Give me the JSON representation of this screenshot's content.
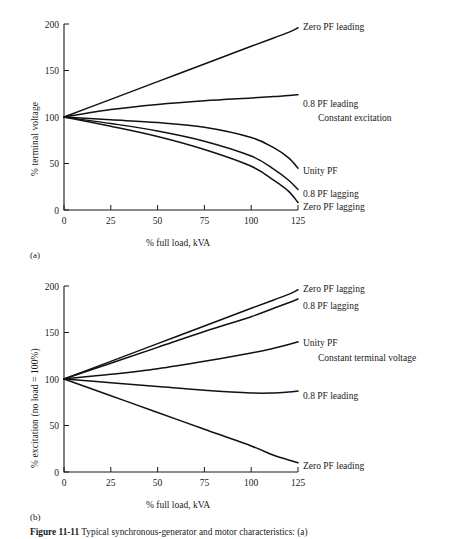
{
  "figure": {
    "caption_bold": "Figure 11-11",
    "caption_text": "Typical synchronous-generator and motor characteristics: (a)",
    "panel_a_tag": "(a)",
    "panel_b_tag": "(b)"
  },
  "chart_data": [
    {
      "type": "line",
      "id": "panel-a",
      "title": "",
      "xlabel": "% full load, kVA",
      "ylabel": "% terminal voltage",
      "annotation": "Constant excitation",
      "xlim": [
        0,
        125
      ],
      "ylim": [
        0,
        200
      ],
      "xticks": [
        0,
        25,
        50,
        75,
        100,
        125
      ],
      "xticklabels": [
        "0",
        "25",
        "50",
        "75",
        "100",
        "125"
      ],
      "yticks": [
        0,
        50,
        100,
        150,
        200
      ],
      "yticklabels": [
        "0",
        "50",
        "100",
        "150",
        "200"
      ],
      "grid": false,
      "legend_position": "right-inline",
      "x": [
        0,
        25,
        50,
        75,
        100,
        112,
        120,
        125
      ],
      "series": [
        {
          "name": "Zero PF leading",
          "values": [
            100,
            119,
            138,
            157,
            176,
            185,
            191,
            196
          ]
        },
        {
          "name": "0.8 PF leading",
          "values": [
            100,
            108,
            113.5,
            117.5,
            120.5,
            122,
            123,
            124
          ]
        },
        {
          "name": "Unity PF",
          "values": [
            100,
            97,
            94,
            89,
            78,
            67,
            56,
            45
          ]
        },
        {
          "name": "0.8 PF lagging",
          "values": [
            100,
            93,
            85,
            74,
            58,
            44,
            32,
            22
          ]
        },
        {
          "name": "Zero PF lagging",
          "values": [
            100,
            90,
            79,
            65,
            47,
            32,
            20,
            8
          ]
        }
      ]
    },
    {
      "type": "line",
      "id": "panel-b",
      "title": "",
      "xlabel": "% full load, kVA",
      "ylabel": "% excitation (no load = 100%)",
      "annotation": "Constant terminal voltage",
      "xlim": [
        0,
        125
      ],
      "ylim": [
        0,
        200
      ],
      "xticks": [
        0,
        25,
        50,
        75,
        100,
        125
      ],
      "xticklabels": [
        "0",
        "25",
        "50",
        "75",
        "100",
        "125"
      ],
      "yticks": [
        0,
        50,
        100,
        150,
        200
      ],
      "yticklabels": [
        "0",
        "50",
        "100",
        "150",
        "200"
      ],
      "grid": false,
      "legend_position": "right-inline",
      "x": [
        0,
        25,
        50,
        75,
        100,
        112,
        120,
        125
      ],
      "series": [
        {
          "name": "Zero PF lagging",
          "values": [
            100,
            119,
            138,
            157,
            176,
            185,
            191,
            196
          ]
        },
        {
          "name": "0.8 PF lagging",
          "values": [
            100,
            117,
            134,
            151,
            167,
            176,
            182,
            186
          ]
        },
        {
          "name": "Unity PF",
          "values": [
            100,
            105,
            111,
            119,
            128,
            133,
            137,
            140
          ]
        },
        {
          "name": "0.8 PF leading",
          "values": [
            100,
            96,
            92,
            88,
            85,
            85,
            86,
            87
          ]
        },
        {
          "name": "Zero PF leading",
          "values": [
            100,
            82,
            64,
            46,
            28,
            18,
            13,
            10
          ]
        }
      ]
    }
  ]
}
